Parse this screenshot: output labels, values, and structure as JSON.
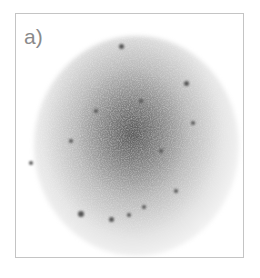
{
  "figure": {
    "panel_label": "a)",
    "colors": {
      "frame": "#c4c4c4",
      "label": "#8a8a8a",
      "core": "#3c3c3c"
    },
    "spots": [
      {
        "x": 120,
        "y": 45,
        "r": 2.5
      },
      {
        "x": 185,
        "y": 82,
        "r": 2.5
      },
      {
        "x": 192,
        "y": 122,
        "r": 2
      },
      {
        "x": 30,
        "y": 162,
        "r": 2
      },
      {
        "x": 80,
        "y": 213,
        "r": 3
      },
      {
        "x": 110,
        "y": 218,
        "r": 2.5
      },
      {
        "x": 128,
        "y": 214,
        "r": 2
      },
      {
        "x": 143,
        "y": 206,
        "r": 2
      },
      {
        "x": 175,
        "y": 190,
        "r": 2
      },
      {
        "x": 95,
        "y": 110,
        "r": 2
      },
      {
        "x": 140,
        "y": 100,
        "r": 2
      },
      {
        "x": 70,
        "y": 140,
        "r": 2
      },
      {
        "x": 160,
        "y": 150,
        "r": 2
      }
    ]
  }
}
